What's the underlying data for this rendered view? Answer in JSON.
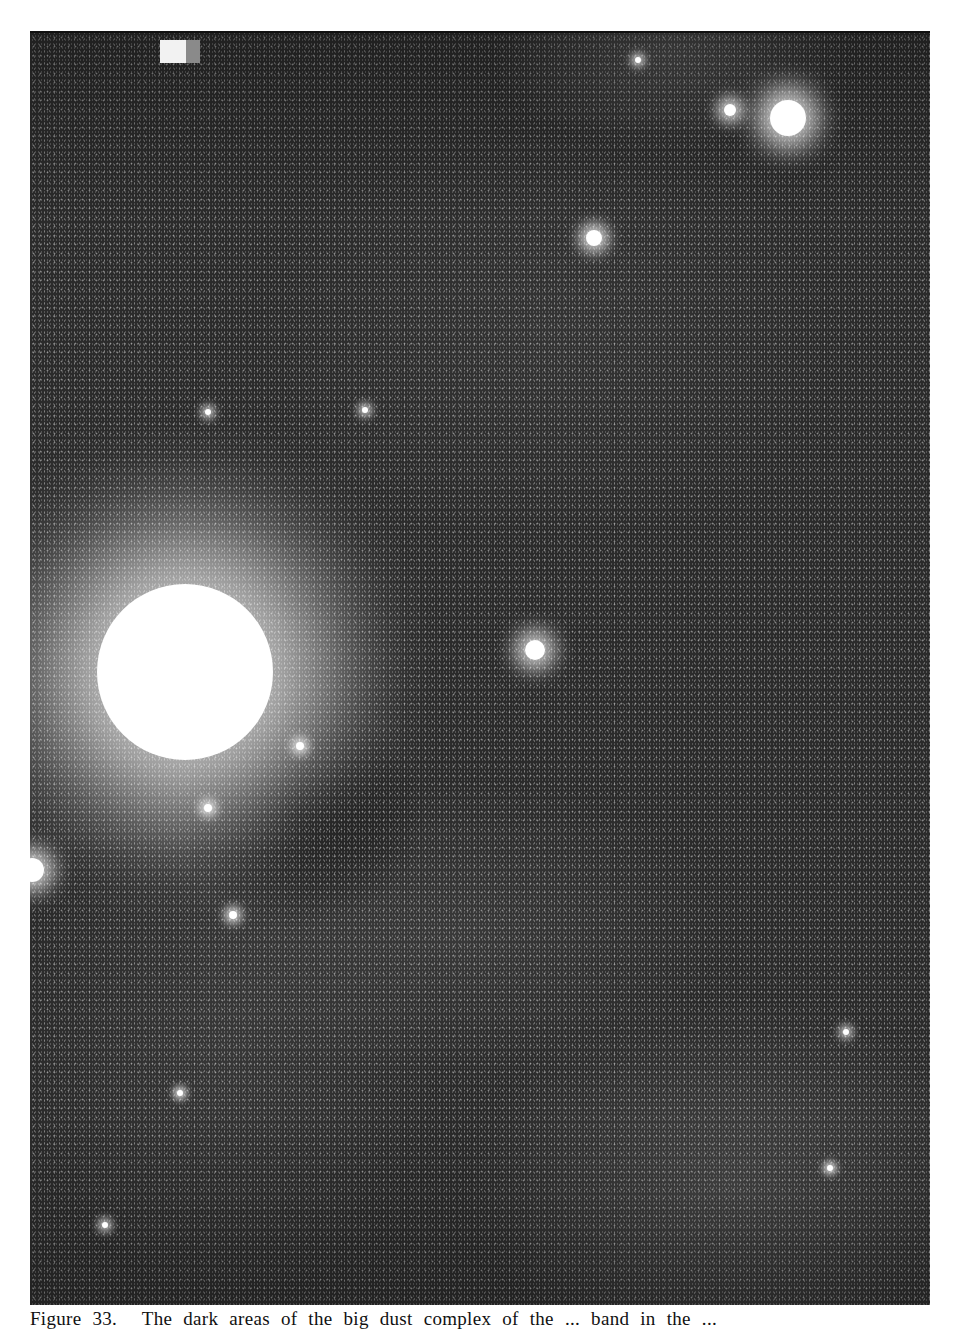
{
  "figure": {
    "caption_label": "Figure 33.",
    "caption_text": "The dark areas of the big dust complex of the ... band in the ..."
  },
  "photo": {
    "description": "Wide-field astronomical photograph of a Milky Way star field with dark dust lanes",
    "tones": {
      "background": "#2b2b2b",
      "star": "#ffffff",
      "page": "#ffffff",
      "caption_ink": "#111111"
    },
    "stars": [
      {
        "name": "bright-star-left",
        "x": 185,
        "y": 672,
        "r": 88,
        "glow": 110
      },
      {
        "name": "bright-star-top-right",
        "x": 788,
        "y": 118,
        "r": 18,
        "glow": 26
      },
      {
        "name": "star-top-right-2",
        "x": 730,
        "y": 110,
        "r": 6,
        "glow": 14
      },
      {
        "name": "star-upper-mid",
        "x": 594,
        "y": 238,
        "r": 8,
        "glow": 14
      },
      {
        "name": "star-center-cluster",
        "x": 535,
        "y": 650,
        "r": 10,
        "glow": 20
      },
      {
        "name": "star-left-edge",
        "x": 32,
        "y": 870,
        "r": 12,
        "glow": 20
      },
      {
        "name": "star-near-dust",
        "x": 300,
        "y": 746,
        "r": 4,
        "glow": 10
      },
      {
        "name": "star-below-bright",
        "x": 208,
        "y": 808,
        "r": 4,
        "glow": 10
      },
      {
        "name": "star-lower-left",
        "x": 233,
        "y": 915,
        "r": 4,
        "glow": 10
      },
      {
        "name": "star-upper-left-1",
        "x": 208,
        "y": 412,
        "r": 3,
        "glow": 8
      },
      {
        "name": "star-upper-left-2",
        "x": 365,
        "y": 410,
        "r": 3,
        "glow": 8
      },
      {
        "name": "star-top-mid",
        "x": 638,
        "y": 60,
        "r": 3,
        "glow": 8
      },
      {
        "name": "star-right-low",
        "x": 846,
        "y": 1032,
        "r": 3,
        "glow": 8
      },
      {
        "name": "star-lower-left-2",
        "x": 105,
        "y": 1225,
        "r": 3,
        "glow": 8
      },
      {
        "name": "star-lower-right",
        "x": 830,
        "y": 1168,
        "r": 3,
        "glow": 7
      },
      {
        "name": "star-mid-left",
        "x": 180,
        "y": 1093,
        "r": 3,
        "glow": 7
      }
    ]
  }
}
